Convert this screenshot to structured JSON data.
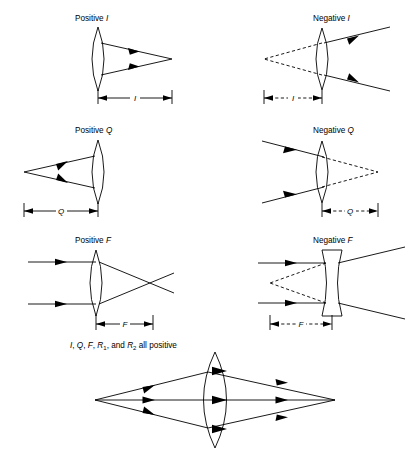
{
  "figure": {
    "background_color": "#ffffff",
    "line_color": "#000000",
    "panels": [
      {
        "id": "positive-i",
        "title_prefix": "Positive ",
        "title_symbol": "I",
        "sign": "positive",
        "lens_type": "biconvex",
        "ray_direction": "left-to-right",
        "image_type": "real",
        "dimension_label": "I",
        "dimension_style": "solid",
        "description": "Converging rays exit lens to a real point to the right; distance I measured from lens to image point."
      },
      {
        "id": "negative-i",
        "title_prefix": "Negative ",
        "title_symbol": "I",
        "sign": "negative",
        "lens_type": "biconvex",
        "ray_direction": "left-to-right",
        "image_type": "virtual",
        "dimension_label": "I",
        "dimension_style": "dashed",
        "description": "Diverging rays exit lens; dashed back-extensions meet at a virtual point left of the lens; distance I is dashed."
      },
      {
        "id": "positive-q",
        "title_prefix": "Positive ",
        "title_symbol": "Q",
        "sign": "positive",
        "lens_type": "biconvex",
        "ray_direction": "left-to-right",
        "image_type": "real",
        "dimension_label": "Q",
        "dimension_style": "solid",
        "description": "Rays diverge from a real object point at left and enter the lens; distance Q from object to lens."
      },
      {
        "id": "negative-q",
        "title_prefix": "Negative ",
        "title_symbol": "Q",
        "sign": "negative",
        "lens_type": "biconvex",
        "ray_direction": "left-to-right",
        "image_type": "virtual",
        "dimension_label": "Q",
        "dimension_style": "dashed",
        "description": "Converging rays enter lens; dashed forward-extensions meet at a virtual object point right of lens; distance Q is dashed."
      },
      {
        "id": "positive-f",
        "title_prefix": "Positive ",
        "title_symbol": "F",
        "sign": "positive",
        "lens_type": "biconvex",
        "ray_direction": "left-to-right",
        "image_type": "real",
        "dimension_label": "F",
        "dimension_style": "solid",
        "description": "Parallel rays enter converging lens and cross at a real focal point; focal length F measured from lens."
      },
      {
        "id": "negative-f",
        "title_prefix": "Negative ",
        "title_symbol": "F",
        "sign": "negative",
        "lens_type": "biconcave",
        "ray_direction": "left-to-right",
        "image_type": "virtual",
        "dimension_label": "F",
        "dimension_style": "dashed",
        "description": "Parallel rays enter diverging lens and spread; dashed back-extensions meet at a virtual focus left of lens; F is dashed."
      }
    ],
    "summary_panel": {
      "id": "all-positive",
      "caption_parts": [
        {
          "text": "I",
          "italic": true
        },
        {
          "text": ", ",
          "italic": false
        },
        {
          "text": "Q",
          "italic": true
        },
        {
          "text": ", ",
          "italic": false
        },
        {
          "text": "F",
          "italic": true
        },
        {
          "text": ", ",
          "italic": false
        },
        {
          "text": "R",
          "italic": true
        },
        {
          "text": "1",
          "italic": false,
          "subscript": true
        },
        {
          "text": ", and ",
          "italic": false
        },
        {
          "text": "R",
          "italic": true
        },
        {
          "text": "2",
          "italic": false,
          "subscript": true
        },
        {
          "text": " all positive",
          "italic": false
        }
      ],
      "caption_plain": "I, Q, F, R1, and R2 all positive",
      "lens_type": "biconvex",
      "ray_count": 3,
      "description": "Three ray pairs leave a real object point at left, pass through a large biconvex lens and converge to a real image point at right; optical axis drawn through center."
    }
  }
}
